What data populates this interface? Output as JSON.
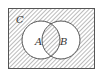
{
  "diagram": {
    "type": "venn",
    "universe_label": "C",
    "sets": [
      {
        "label": "A"
      },
      {
        "label": "B"
      }
    ],
    "shaded_regions": [
      "C outside A and B",
      "A ∩ B"
    ],
    "colors": {
      "stroke": "#555555",
      "hatch": "#777777",
      "background": "#ffffff"
    }
  }
}
